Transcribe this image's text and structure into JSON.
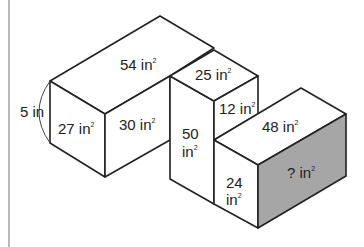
{
  "diagram": {
    "type": "isometric composite solid",
    "dimension_label": "5 in",
    "faces": [
      {
        "id": "big-top",
        "value": "54",
        "unit": "in",
        "exp": "2"
      },
      {
        "id": "big-left",
        "value": "27",
        "unit": "in",
        "exp": "2"
      },
      {
        "id": "big-front",
        "value": "30",
        "unit": "in",
        "exp": "2"
      },
      {
        "id": "tall-front",
        "value": "50",
        "unit": "in",
        "exp": "2"
      },
      {
        "id": "cube-top",
        "value": "25",
        "unit": "in",
        "exp": "2"
      },
      {
        "id": "cube-right",
        "value": "12",
        "unit": "in",
        "exp": "2"
      },
      {
        "id": "low-top",
        "value": "48",
        "unit": "in",
        "exp": "2"
      },
      {
        "id": "low-left",
        "value": "24",
        "unit": "in",
        "exp": "2"
      },
      {
        "id": "unknown",
        "value": "?",
        "unit": "in",
        "exp": "2"
      }
    ],
    "colors": {
      "stroke": "#222222",
      "shaded_face": "#a6a6a6",
      "margin_line": "#a0a0a0",
      "background": "#ffffff"
    }
  }
}
